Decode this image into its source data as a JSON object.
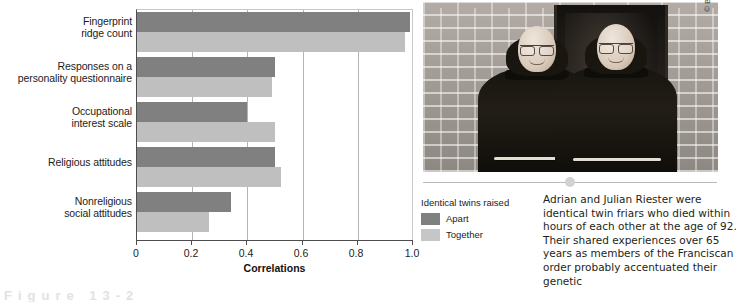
{
  "chart_data": {
    "type": "bar",
    "orientation": "horizontal",
    "title": "",
    "xlabel": "Correlations",
    "ylabel": "",
    "xlim": [
      0,
      1.0
    ],
    "xticks": [
      "0",
      "0.2",
      "0.4",
      "0.6",
      "0.8",
      "1.0"
    ],
    "xtick_values": [
      0,
      0.2,
      0.4,
      0.6,
      0.8,
      1.0
    ],
    "grid": true,
    "legend_position": "below-left",
    "categories": [
      "Fingerprint ridge count",
      "Responses on a personality questionnaire",
      "Occupational interest scale",
      "Religious attitudes",
      "Nonreligious social attitudes"
    ],
    "category_lines": [
      [
        "Fingerprint",
        "ridge count"
      ],
      [
        "Responses on a",
        "personality questionnaire"
      ],
      [
        "Occupational",
        "interest scale"
      ],
      [
        "Religious attitudes"
      ],
      [
        "Nonreligious",
        "social attitudes"
      ]
    ],
    "series": [
      {
        "name": "Apart",
        "color": "#808080",
        "values": [
          0.99,
          0.5,
          0.4,
          0.5,
          0.34
        ]
      },
      {
        "name": "Together",
        "color": "#bfbfbf",
        "values": [
          0.97,
          0.49,
          0.5,
          0.52,
          0.26
        ]
      }
    ]
  },
  "legend": {
    "title": "Identical twins raised",
    "items": [
      {
        "label": "Apart",
        "color": "#808080"
      },
      {
        "label": "Together",
        "color": "#c6c6c6"
      }
    ]
  },
  "photo": {
    "alt": "Two elderly identical twin friars in dark Franciscan habits standing in front of a brick wall and dark doorway",
    "credit": "© Beth Eberth, St. Bonaventure University, St. Bonaventure, N.Y."
  },
  "caption": {
    "text": "Adrian and Julian Riester were identical twin friars who died within hours of each other at the age of 92. Their shared experiences over 65 years as members of the Franciscan order probably accentuated their genetic"
  },
  "figure_footer": {
    "cut_text": "Figure 13-2"
  }
}
